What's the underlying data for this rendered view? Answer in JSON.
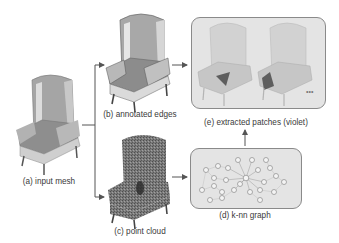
{
  "diagram": {
    "stages": {
      "a": {
        "label": "(a) input mesh"
      },
      "b": {
        "label": "(b) annotated edges"
      },
      "c": {
        "label": "(c) point cloud"
      },
      "d": {
        "label": "(d) k-nn graph"
      },
      "e": {
        "label": "(e) extracted patches (violet)"
      }
    },
    "ellipsis": "•••",
    "edges": [
      {
        "from": "a",
        "to": "b"
      },
      {
        "from": "a",
        "to": "c"
      },
      {
        "from": "b",
        "to": "e"
      },
      {
        "from": "c",
        "to": "d"
      },
      {
        "from": "d",
        "to": "e"
      }
    ],
    "colors": {
      "mesh": "#9a9a9a",
      "mesh_highlight": "#d8d8d8",
      "box_fill": "#e4e4e4",
      "box_border": "#8a8a8a",
      "arrow": "#555555",
      "point_cloud": "#6e6e6e"
    }
  }
}
